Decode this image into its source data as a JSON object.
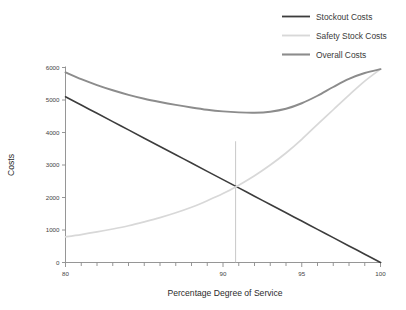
{
  "chart_data": {
    "type": "line",
    "title": "",
    "xlabel": "Percentage Degree of Service",
    "ylabel": "Costs",
    "xlim": [
      80,
      100
    ],
    "ylim": [
      0,
      6000
    ],
    "grid": false,
    "legend_position": "top-right",
    "x_ticks_major": [
      80,
      90,
      95,
      100
    ],
    "x_tick_labels": [
      "80",
      "90",
      "95",
      "100"
    ],
    "x_ticks_minor": [
      81,
      82,
      83,
      84,
      85,
      86,
      87,
      88,
      89,
      91,
      92,
      93,
      94,
      96,
      97,
      98,
      99
    ],
    "y_ticks": [
      0,
      1000,
      2000,
      3000,
      4000,
      5000,
      6000
    ],
    "y_tick_labels": [
      "0",
      "1000",
      "2000",
      "3000",
      "4000",
      "5000",
      "6000"
    ],
    "x": [
      80,
      81,
      82,
      83,
      84,
      85,
      86,
      87,
      88,
      89,
      90,
      91,
      92,
      93,
      94,
      95,
      96,
      97,
      98,
      99,
      100
    ],
    "series": [
      {
        "name": "Stockout Costs",
        "color": "#3c3c3c",
        "width": 1.6,
        "values": [
          5100,
          4845,
          4590,
          4335,
          4080,
          3825,
          3570,
          3315,
          3060,
          2805,
          2550,
          2295,
          2040,
          1785,
          1530,
          1275,
          1020,
          765,
          510,
          255,
          0
        ]
      },
      {
        "name": "Safety Stock Costs",
        "color": "#d8d8d8",
        "width": 1.7,
        "values": [
          790,
          860,
          940,
          1030,
          1130,
          1250,
          1380,
          1530,
          1700,
          1900,
          2120,
          2380,
          2670,
          3000,
          3370,
          3790,
          4250,
          4700,
          5150,
          5580,
          5950
        ]
      },
      {
        "name": "Overall Costs",
        "color": "#8c8c8c",
        "width": 1.9,
        "values": [
          5850,
          5640,
          5460,
          5300,
          5160,
          5040,
          4940,
          4850,
          4770,
          4700,
          4650,
          4620,
          4610,
          4640,
          4730,
          4900,
          5130,
          5400,
          5650,
          5830,
          5950
        ]
      }
    ],
    "annotations": [
      {
        "name": "optimum-dropline",
        "x": 90.8,
        "y_from": 3730,
        "y_to": 0,
        "label": ""
      }
    ],
    "optimum": {
      "x": 90.8,
      "overall_cost": 3730,
      "stockout_cost": 2150,
      "safety_stock_cost": 2150
    }
  },
  "legend": {
    "items": [
      {
        "label": "Stockout Costs"
      },
      {
        "label": "Safety Stock Costs"
      },
      {
        "label": "Overall Costs"
      }
    ]
  },
  "axes": {
    "x_title": "Percentage Degree of Service",
    "y_title": "Costs"
  }
}
